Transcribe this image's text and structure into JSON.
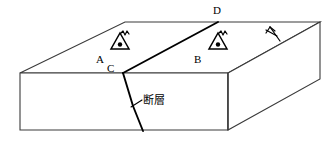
{
  "figure": {
    "type": "geological-block-diagram",
    "background_color": "#ffffff",
    "line_color": "#3a3a3a",
    "fault_line_color": "#000000",
    "text_color": "#000000"
  },
  "vertices": {
    "D": "D",
    "C": "C"
  },
  "stations": [
    {
      "id": "A",
      "label": "A",
      "symbol": "triangle-dot-antenna-icon"
    },
    {
      "id": "B",
      "label": "B",
      "symbol": "triangle-dot-antenna-icon"
    }
  ],
  "annotations": {
    "fault": "断層"
  },
  "symbols": {
    "north_arrow": "north-arrow-icon",
    "station_marker": "triangle-with-center-dot",
    "station_antenna": "zigzag-antenna"
  },
  "geometry": {
    "top_face": [
      [
        20,
        73
      ],
      [
        125,
        22
      ],
      [
        320,
        22
      ],
      [
        228,
        73
      ]
    ],
    "front_face": [
      [
        20,
        73
      ],
      [
        228,
        73
      ],
      [
        228,
        130
      ],
      [
        20,
        130
      ]
    ],
    "right_face": [
      [
        228,
        73
      ],
      [
        320,
        22
      ],
      [
        320,
        79
      ],
      [
        228,
        130
      ]
    ],
    "fault_top": [
      [
        123,
        73
      ],
      [
        218,
        22
      ]
    ],
    "fault_front": [
      [
        123,
        73
      ],
      [
        133,
        105
      ],
      [
        143,
        130
      ]
    ],
    "leader_line": [
      [
        143,
        101
      ],
      [
        132,
        107
      ]
    ]
  }
}
